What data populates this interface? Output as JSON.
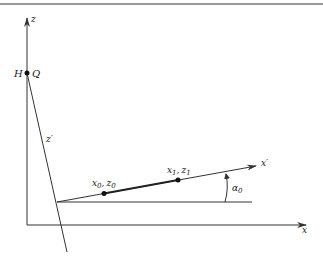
{
  "diagram": {
    "type": "coordinate-rotation",
    "axes": {
      "z": "z",
      "x": "x",
      "z_prime": "z",
      "x_prime": "x"
    },
    "prime_mark": "′",
    "points": {
      "H": "H",
      "Q": "Q",
      "p0_x": "x",
      "p0_z": "z",
      "p0_sub": "0",
      "p1_x": "x",
      "p1_z": "z",
      "p1_sub": "1",
      "comma": ","
    },
    "angle": {
      "symbol": "α",
      "sub": "0"
    },
    "colors": {
      "line": "#333333",
      "rule": "#777777"
    }
  }
}
